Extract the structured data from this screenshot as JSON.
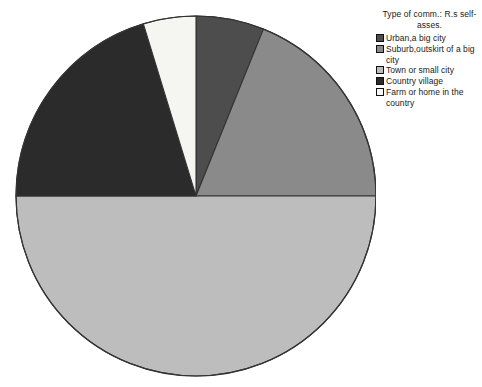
{
  "chart_data": {
    "type": "pie",
    "title": "Type of comm.: R.s self-asses.",
    "xlabel": "",
    "ylabel": "",
    "legend_position": "right",
    "grid": false,
    "start_angle_deg": 0,
    "direction": "clockwise",
    "categories": [
      "Urban,a big city",
      "Suburb,outskirt of a big city",
      "Town or small city",
      "Country village",
      "Farm or home in the country"
    ],
    "values": [
      6.1,
      18.9,
      50.0,
      20.3,
      4.7
    ],
    "value_unit": "percent",
    "angles_deg": [
      22,
      68,
      180,
      73,
      17
    ],
    "colors": [
      "#4d4d4d",
      "#8a8a8a",
      "#bdbdbd",
      "#2b2b2b",
      "#f5f5f2"
    ],
    "slices": [
      {
        "label": "Urban,a big city",
        "value": 6.1,
        "angle_deg": 22,
        "color": "#4d4d4d"
      },
      {
        "label": "Suburb,outskirt of a big city",
        "value": 18.9,
        "angle_deg": 68,
        "color": "#8a8a8a"
      },
      {
        "label": "Town or small city",
        "value": 50.0,
        "angle_deg": 180,
        "color": "#bdbdbd"
      },
      {
        "label": "Country village",
        "value": 20.3,
        "angle_deg": 73,
        "color": "#2b2b2b"
      },
      {
        "label": "Farm or home in the country",
        "value": 4.7,
        "angle_deg": 17,
        "color": "#f5f5f2"
      }
    ]
  },
  "legend": {
    "title": "Type of comm.: R.s\nself-asses.",
    "items": [
      {
        "label": "Urban,a big city",
        "color": "#4d4d4d"
      },
      {
        "label": "Suburb,outskirt of a big city",
        "color": "#8a8a8a"
      },
      {
        "label": "Town or small city",
        "color": "#bdbdbd"
      },
      {
        "label": "Country village",
        "color": "#2b2b2b"
      },
      {
        "label": "Farm or home in the\ncountry",
        "color": "#f5f5f2"
      }
    ]
  },
  "geometry": {
    "center_x": 196,
    "center_y": 196,
    "radius": 180,
    "outline_color": "#333333"
  }
}
